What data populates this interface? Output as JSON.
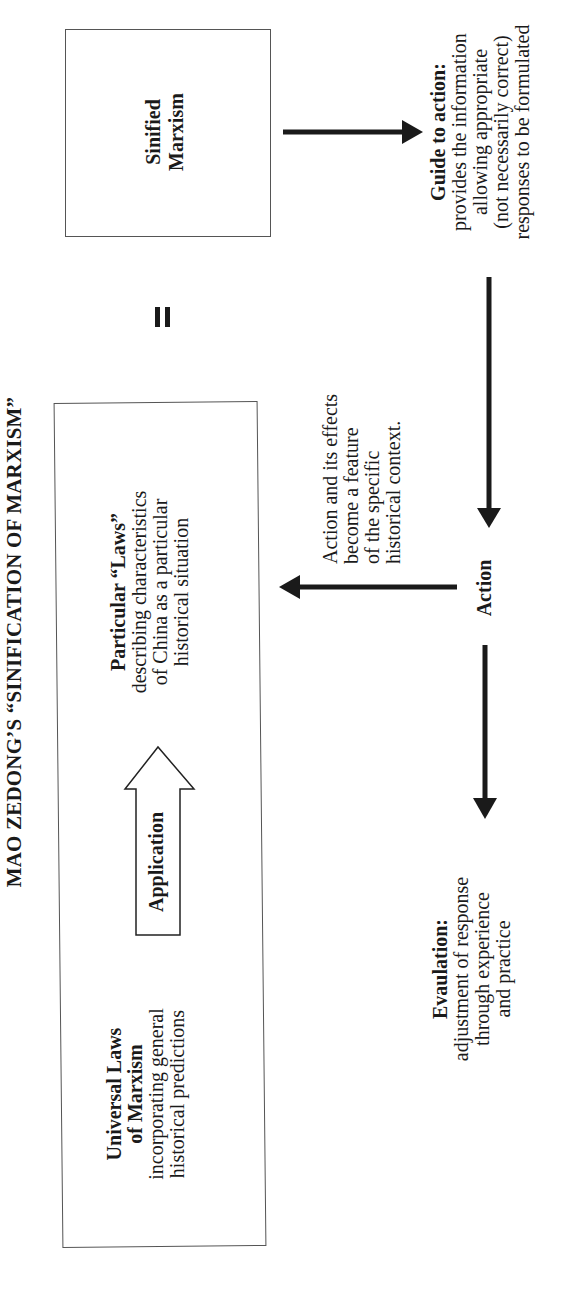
{
  "title": "MAO ZEDONG’S “SINIFICATION OF MARXISM”",
  "boxes": {
    "universal": {
      "heading": [
        "Universal Laws",
        "of Marxism"
      ],
      "body": [
        "incorporating general",
        "historical predictions"
      ]
    },
    "application_arrow": {
      "label": "Application"
    },
    "particular": {
      "heading": [
        "Particular “Laws”"
      ],
      "body": [
        "describing characteristics",
        "of China as a particular",
        "historical situation"
      ]
    },
    "equals_sign": "=",
    "sinified": {
      "heading": [
        "Sinified",
        "Marxism"
      ]
    }
  },
  "nodes": {
    "guide": {
      "heading": "Guide to action:",
      "body": [
        "provides the information",
        "allowing appropriate",
        "(not necessarily correct)",
        "responses to be formulated"
      ]
    },
    "action": {
      "label": "Action"
    },
    "effects": {
      "body": [
        "Action and its effects",
        "become a feature",
        "of the specific",
        "historical context."
      ]
    },
    "evaluation": {
      "heading": "Evaulation:",
      "body": [
        "adjustment of response",
        "through experience",
        "and practice"
      ]
    }
  },
  "colors": {
    "arrow": "#1a1a1a",
    "box_border": "#555555",
    "text": "#1a1a1a",
    "background": "#ffffff"
  }
}
